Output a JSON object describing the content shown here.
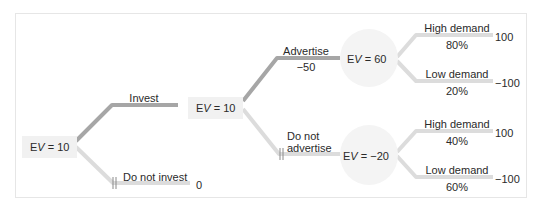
{
  "colors": {
    "chosen_branch": "#a6a6a6",
    "other_branch": "#dcdcdc",
    "decision_node_bg": "#f1f1f1",
    "chance_node_bg": "#f4f4f4",
    "frame_border": "#e6e6e6",
    "text": "#2a2a2a"
  },
  "tree": {
    "root": {
      "label": "EV = 10",
      "type": "decision"
    },
    "invest_branch": {
      "label": "Invest",
      "chosen": true
    },
    "not_invest_branch": {
      "label": "Do not invest",
      "payoff": "0",
      "pruned": true
    },
    "invest_node": {
      "label": "EV = 10",
      "type": "decision"
    },
    "advertise_branch": {
      "label": "Advertise",
      "cost": "−50",
      "chosen": true
    },
    "not_advertise_branch": {
      "label_line1": "Do not",
      "label_line2": "advertise",
      "pruned": true
    },
    "advertise_node": {
      "label": "EV = 60",
      "type": "chance",
      "outcomes": [
        {
          "label": "High demand",
          "probability": "80%",
          "payoff": "100"
        },
        {
          "label": "Low demand",
          "probability": "20%",
          "payoff": "−100"
        }
      ]
    },
    "not_advertise_node": {
      "label": "EV = −20",
      "type": "chance",
      "outcomes": [
        {
          "label": "High demand",
          "probability": "40%",
          "payoff": "100"
        },
        {
          "label": "Low demand",
          "probability": "60%",
          "payoff": "−100"
        }
      ]
    }
  }
}
